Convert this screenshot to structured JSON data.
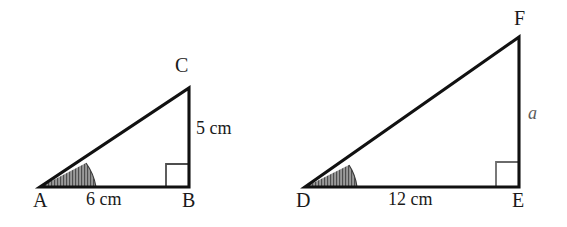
{
  "figure": {
    "type": "geometry-diagram",
    "background_color": "#ffffff",
    "stroke_color": "#111111",
    "angle_fill_color": "#808080",
    "right_angle_color": "#4d4d4d",
    "variable_color": "#5b5b5b"
  },
  "triangles": [
    {
      "id": "ABC",
      "vertices": {
        "C": "C",
        "A": "A",
        "B": "B"
      },
      "sides": {
        "base_label": "6 cm",
        "base_value": 6,
        "height_label": "5 cm",
        "height_value": 5,
        "unit": "cm"
      },
      "right_angle_at": "B",
      "marked_angle_at": "A",
      "angle_shaded": true
    },
    {
      "id": "DEF",
      "vertices": {
        "F": "F",
        "D": "D",
        "E": "E"
      },
      "sides": {
        "base_label": "12 cm",
        "base_value": 12,
        "height_label": "a",
        "height_value": null,
        "unit": "cm"
      },
      "right_angle_at": "E",
      "marked_angle_at": "D",
      "angle_shaded": true
    }
  ]
}
